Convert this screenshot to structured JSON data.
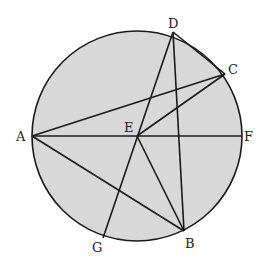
{
  "diagram": {
    "type": "circle-geometry",
    "circle": {
      "cx": 137,
      "cy": 136,
      "r": 105,
      "fill": "#d8d8d8",
      "stroke": "#1a1a1a"
    },
    "points": {
      "A": {
        "x": 32,
        "y": 136,
        "label": "A",
        "lx": 16,
        "ly": 141
      },
      "E": {
        "x": 137,
        "y": 136,
        "label": "E",
        "lx": 124,
        "ly": 132
      },
      "F": {
        "x": 242,
        "y": 136,
        "label": "F",
        "lx": 244,
        "ly": 141
      },
      "D": {
        "x": 173,
        "y": 32,
        "label": "D",
        "lx": 168,
        "ly": 28
      },
      "C": {
        "x": 225,
        "y": 74,
        "label": "C",
        "lx": 228,
        "ly": 74
      },
      "B": {
        "x": 184,
        "y": 231,
        "label": "B",
        "lx": 185,
        "ly": 248
      },
      "G": {
        "x": 103,
        "y": 238,
        "label": "G",
        "lx": 92,
        "ly": 252
      }
    },
    "segments": [
      [
        "A",
        "F"
      ],
      [
        "A",
        "C"
      ],
      [
        "A",
        "B"
      ],
      [
        "E",
        "C"
      ],
      [
        "E",
        "B"
      ],
      [
        "D",
        "G"
      ],
      [
        "D",
        "B"
      ],
      [
        "D",
        "C"
      ]
    ]
  }
}
